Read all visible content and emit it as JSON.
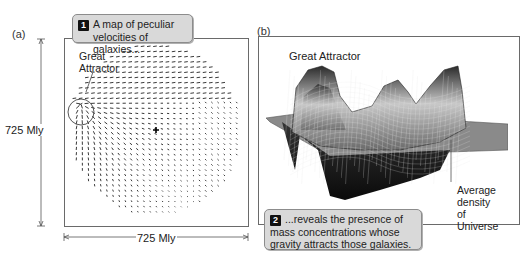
{
  "panel_a": {
    "label": "(a)",
    "callout": {
      "number": "1",
      "line1": "A map of peculiar",
      "line2": "velocities of galaxies..."
    },
    "annotation": {
      "line1": "Great",
      "line2": "Attractor"
    },
    "vertical_dimension": "725 Mly",
    "horizontal_dimension": "725 Mly"
  },
  "panel_b": {
    "label": "(b)",
    "annotation_top": "Great Attractor",
    "annotation_right": {
      "line1": "Average",
      "line2": "density",
      "line3": "of Universe"
    },
    "callout": {
      "number": "2",
      "line1": "...reveals the presence of",
      "line2": "mass concentrations whose",
      "line3": "gravity attracts those galaxies."
    }
  },
  "colors": {
    "frame": "#6a6a6a",
    "callout_bg": "#d9d9d9",
    "callout_border": "#8c8c8c",
    "arrow": "#444444",
    "surface_dark": "#1a1a1a",
    "surface_light": "#bdbdbd"
  }
}
